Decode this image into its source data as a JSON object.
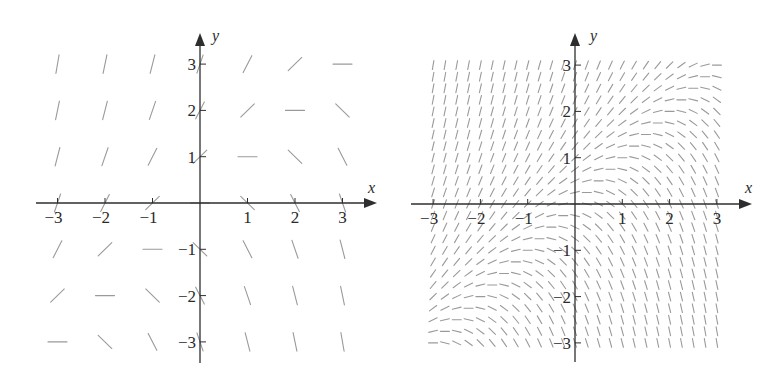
{
  "chart_data": [
    {
      "type": "slope-field",
      "panel": "left",
      "title": "",
      "equation_inferred": "dy/dx = y - x",
      "xlabel": "x",
      "ylabel": "y",
      "xlim": [
        -3,
        3
      ],
      "ylim": [
        -3,
        3
      ],
      "grid_step": 1,
      "grid_on": false,
      "legend": null,
      "x_ticks": [
        -3,
        -2,
        -1,
        1,
        2,
        3
      ],
      "y_ticks": [
        -3,
        -2,
        -1,
        1,
        2,
        3
      ],
      "x_tick_labels": [
        "−3",
        "−2",
        "−1",
        "1",
        "2",
        "3"
      ],
      "y_tick_labels": [
        "−3",
        "−2",
        "−1",
        "1",
        "2",
        "3"
      ],
      "origin_px": [
        200,
        203
      ],
      "unit_px": [
        47.5,
        46.3
      ],
      "segment_length_px": 19,
      "axis_extent_px": {
        "x_start": 36,
        "x_end": 377,
        "y_top": 33,
        "y_bottom": 363
      },
      "x_label_pos_px": [
        368,
        193
      ],
      "y_label_pos_px": [
        212,
        41
      ]
    },
    {
      "type": "slope-field",
      "panel": "right",
      "title": "",
      "equation_inferred": "dy/dx = y - x",
      "xlabel": "x",
      "ylabel": "y",
      "xlim": [
        -3,
        3
      ],
      "ylim": [
        -3,
        3
      ],
      "grid_step": 0.25,
      "grid_on": false,
      "legend": null,
      "x_ticks": [
        -3,
        -2,
        -1,
        1,
        2,
        3
      ],
      "y_ticks": [
        -3,
        -2,
        -1,
        1,
        2,
        3
      ],
      "x_tick_labels": [
        "−3",
        "−2",
        "−1",
        "1",
        "2",
        "3"
      ],
      "y_tick_labels": [
        "−3",
        "−2",
        "−1",
        "1",
        "2",
        "3"
      ],
      "origin_px": [
        575,
        204
      ],
      "unit_px": [
        47.3,
        46.3
      ],
      "segment_length_px": 9,
      "axis_extent_px": {
        "x_start": 411,
        "x_end": 752,
        "y_top": 33,
        "y_bottom": 362
      },
      "x_label_pos_px": [
        745,
        193
      ],
      "y_label_pos_px": [
        590,
        41
      ]
    }
  ],
  "colors": {
    "axis": "#2e2e2e",
    "segment": "#9a9a9a",
    "label": "#2a2a2a",
    "background": "#ffffff"
  }
}
